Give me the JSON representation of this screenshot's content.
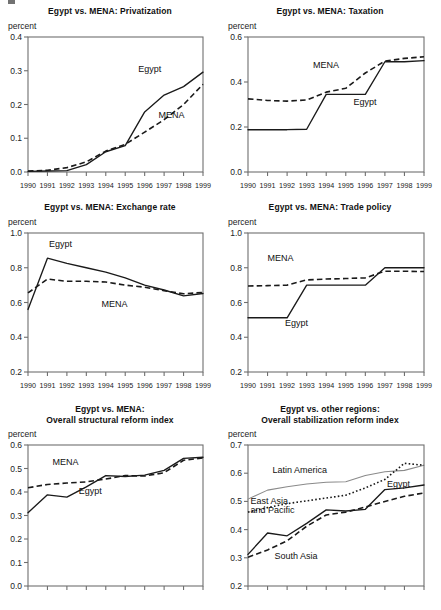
{
  "figure": {
    "unit_label": "percent",
    "x_tick_labels": [
      "1990",
      "1991",
      "1992",
      "1993",
      "1994",
      "1995",
      "1996",
      "1997",
      "1998",
      "1999"
    ],
    "colors": {
      "line": "#1a1a1a",
      "axis": "#6f6f6f",
      "thin_line": "#8a8a8a",
      "background": "#ffffff"
    }
  },
  "chart_data": [
    {
      "id": "privatization",
      "type": "line",
      "title": "Egypt vs. MENA: Privatization",
      "xlabel": "",
      "ylabel": "percent",
      "x": [
        "1990",
        "1991",
        "1992",
        "1993",
        "1994",
        "1995",
        "1996",
        "1997",
        "1998",
        "1999"
      ],
      "xlim": [
        1990,
        1999
      ],
      "ylim": [
        0.0,
        0.4
      ],
      "yticks": [
        "0.0",
        "0.1",
        "0.2",
        "0.3",
        "0.4"
      ],
      "grid": false,
      "legend_position": "inline-annotation",
      "series": [
        {
          "name": "Egypt",
          "style": "solid",
          "values": [
            0.002,
            0.003,
            0.004,
            0.022,
            0.06,
            0.078,
            0.178,
            0.228,
            0.253,
            0.296
          ]
        },
        {
          "name": "MENA",
          "style": "dashed",
          "values": [
            0.003,
            0.005,
            0.013,
            0.03,
            0.062,
            0.082,
            0.118,
            0.155,
            0.2,
            0.26
          ]
        }
      ]
    },
    {
      "id": "taxation",
      "type": "line",
      "title": "Egypt vs. MENA: Taxation",
      "xlabel": "",
      "ylabel": "percent",
      "x": [
        "1990",
        "1991",
        "1992",
        "1993",
        "1994",
        "1995",
        "1996",
        "1997",
        "1998",
        "1999"
      ],
      "xlim": [
        1990,
        1999
      ],
      "ylim": [
        0.0,
        0.6
      ],
      "yticks": [
        "0.0",
        "0.2",
        "0.4",
        "0.6"
      ],
      "grid": false,
      "legend_position": "inline-annotation",
      "series": [
        {
          "name": "MENA",
          "style": "dashed",
          "values": [
            0.325,
            0.318,
            0.315,
            0.32,
            0.355,
            0.372,
            0.44,
            0.493,
            0.505,
            0.512
          ]
        },
        {
          "name": "Egypt",
          "style": "solid",
          "values": [
            0.188,
            0.188,
            0.188,
            0.19,
            0.345,
            0.345,
            0.345,
            0.49,
            0.49,
            0.495
          ]
        }
      ]
    },
    {
      "id": "exchange-rate",
      "type": "line",
      "title": "Egypt vs. MENA: Exchange rate",
      "xlabel": "",
      "ylabel": "percent",
      "x": [
        "1990",
        "1991",
        "1992",
        "1993",
        "1994",
        "1995",
        "1996",
        "1997",
        "1998",
        "1999"
      ],
      "xlim": [
        1990,
        1999
      ],
      "ylim": [
        0.2,
        1.0
      ],
      "yticks": [
        "0.2",
        "0.4",
        "0.6",
        "0.8",
        "1.0"
      ],
      "grid": false,
      "legend_position": "inline-annotation",
      "series": [
        {
          "name": "Egypt",
          "style": "solid",
          "values": [
            0.56,
            0.855,
            0.825,
            0.8,
            0.775,
            0.742,
            0.7,
            0.672,
            0.638,
            0.652
          ]
        },
        {
          "name": "MENA",
          "style": "dashed",
          "values": [
            0.655,
            0.735,
            0.722,
            0.722,
            0.718,
            0.7,
            0.688,
            0.668,
            0.65,
            0.658
          ]
        }
      ]
    },
    {
      "id": "trade-policy",
      "type": "line",
      "title": "Egypt vs. MENA: Trade policy",
      "xlabel": "",
      "ylabel": "percent",
      "x": [
        "1990",
        "1991",
        "1992",
        "1993",
        "1994",
        "1995",
        "1996",
        "1997",
        "1998",
        "1999"
      ],
      "xlim": [
        1990,
        1999
      ],
      "ylim": [
        0.2,
        1.0
      ],
      "yticks": [
        "0.2",
        "0.4",
        "0.6",
        "0.8",
        "1.0"
      ],
      "grid": false,
      "legend_position": "inline-annotation",
      "series": [
        {
          "name": "MENA",
          "style": "dashed",
          "values": [
            0.695,
            0.697,
            0.7,
            0.73,
            0.735,
            0.738,
            0.742,
            0.78,
            0.78,
            0.778
          ]
        },
        {
          "name": "Egypt",
          "style": "solid",
          "values": [
            0.512,
            0.512,
            0.512,
            0.7,
            0.7,
            0.7,
            0.7,
            0.8,
            0.8,
            0.8
          ]
        }
      ]
    },
    {
      "id": "structural-reform-index",
      "type": "line",
      "title": "Egypt vs. MENA:\nOverall structural reform index",
      "title_line_1": "Egypt vs. MENA:",
      "title_line_2": "Overall structural reform index",
      "xlabel": "",
      "ylabel": "percent",
      "x": [
        "1990",
        "1991",
        "1992",
        "1993",
        "1994",
        "1995",
        "1996",
        "1997",
        "1998",
        "1999"
      ],
      "xlim": [
        1990,
        1999
      ],
      "ylim": [
        0.0,
        0.6
      ],
      "yticks": [
        "0.0",
        "0.1",
        "0.2",
        "0.3",
        "0.4",
        "0.5",
        "0.6"
      ],
      "grid": false,
      "legend_position": "inline-annotation",
      "series": [
        {
          "name": "MENA",
          "style": "dashed",
          "values": [
            0.418,
            0.432,
            0.438,
            0.443,
            0.455,
            0.47,
            0.468,
            0.482,
            0.535,
            0.545
          ]
        },
        {
          "name": "Egypt",
          "style": "solid",
          "values": [
            0.312,
            0.388,
            0.378,
            0.422,
            0.47,
            0.466,
            0.472,
            0.492,
            0.543,
            0.548
          ]
        }
      ]
    },
    {
      "id": "stabilization-reform-index",
      "type": "line",
      "title": "Egypt vs. other regions:\nOverall stabilization reform index",
      "title_line_1": "Egypt vs. other regions:",
      "title_line_2": "Overall stabilization reform index",
      "xlabel": "",
      "ylabel": "percent",
      "x": [
        "1990",
        "1991",
        "1992",
        "1993",
        "1994",
        "1995",
        "1996",
        "1997",
        "1998",
        "1999"
      ],
      "xlim": [
        1990,
        1999
      ],
      "ylim": [
        0.2,
        0.7
      ],
      "yticks": [
        "0.2",
        "0.3",
        "0.4",
        "0.5",
        "0.6",
        "0.7"
      ],
      "grid": false,
      "legend_position": "inline-annotation",
      "series": [
        {
          "name": "Latin America",
          "style": "thin-solid",
          "values": [
            0.508,
            0.54,
            0.552,
            0.562,
            0.568,
            0.57,
            0.592,
            0.605,
            0.61,
            0.628
          ]
        },
        {
          "name": "East Asia and Pacific",
          "style": "dotted",
          "values": [
            0.462,
            0.478,
            0.492,
            0.502,
            0.512,
            0.522,
            0.548,
            0.578,
            0.635,
            0.628
          ]
        },
        {
          "name": "Egypt",
          "style": "solid",
          "values": [
            0.312,
            0.388,
            0.378,
            0.422,
            0.47,
            0.466,
            0.472,
            0.542,
            0.548,
            0.558
          ]
        },
        {
          "name": "South Asia",
          "style": "dashed",
          "values": [
            0.302,
            0.328,
            0.36,
            0.412,
            0.452,
            0.462,
            0.48,
            0.5,
            0.518,
            0.53
          ]
        }
      ]
    }
  ],
  "panels": [
    {
      "title": "Egypt vs. MENA: Privatization",
      "unit": "percent"
    },
    {
      "title": "Egypt vs. MENA: Taxation",
      "unit": "percent"
    },
    {
      "title": "Egypt vs. MENA: Exchange rate",
      "unit": "percent"
    },
    {
      "title": "Egypt vs. MENA: Trade policy",
      "unit": "percent"
    },
    {
      "title_line_1": "Egypt vs. MENA:",
      "title_line_2": "Overall structural reform index",
      "unit": "percent"
    },
    {
      "title_line_1": "Egypt vs. other regions:",
      "title_line_2": "Overall stabilization reform index",
      "unit": "percent"
    }
  ]
}
